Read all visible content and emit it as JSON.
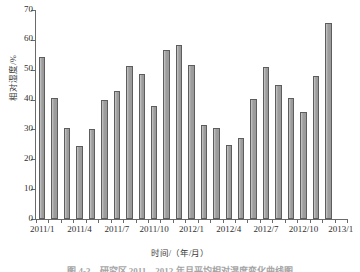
{
  "figure": {
    "caption": "图 4-3　研究区 2011—2012 年月平均相对湿度变化曲线图"
  },
  "chart_data": {
    "type": "bar",
    "title": "",
    "xlabel": "时间/（年/月）",
    "ylabel": "相对湿度/%",
    "ylim": [
      0,
      70
    ],
    "ytick_values": [
      0,
      10,
      20,
      30,
      40,
      50,
      60,
      70
    ],
    "ytick_labels": [
      "0",
      "10",
      "20",
      "30",
      "40",
      "50",
      "60",
      "70"
    ],
    "grid": false,
    "legend": null,
    "bar_color": "#9a9a9a",
    "bar_edge_color": "#5d5d5d",
    "axis_color": "#6a6a6a",
    "categories": [
      "2011/1",
      "2011/2",
      "2011/3",
      "2011/4",
      "2011/5",
      "2011/6",
      "2011/7",
      "2011/8",
      "2011/9",
      "2011/10",
      "2011/11",
      "2011/12",
      "2012/1",
      "2012/2",
      "2012/3",
      "2012/4",
      "2012/5",
      "2012/6",
      "2012/7",
      "2012/8",
      "2012/9",
      "2012/10",
      "2012/11",
      "2012/12",
      "2013/1"
    ],
    "values": [
      54.3,
      40.5,
      30.5,
      24.4,
      30.3,
      39.8,
      43.0,
      51.4,
      48.7,
      38.0,
      56.5,
      58.2,
      51.7,
      31.6,
      30.6,
      24.8,
      27.2,
      40.1,
      51.0,
      44.8,
      40.6,
      35.8,
      47.8,
      65.6,
      0.0
    ],
    "xtick_labels": [
      "2011/1",
      "2011/4",
      "2011/7",
      "2011/10",
      "2012/1",
      "2012/4",
      "2012/7",
      "2012/10",
      "2013/1"
    ],
    "xtick_indices": [
      0,
      3,
      6,
      9,
      12,
      15,
      18,
      21,
      24
    ]
  }
}
